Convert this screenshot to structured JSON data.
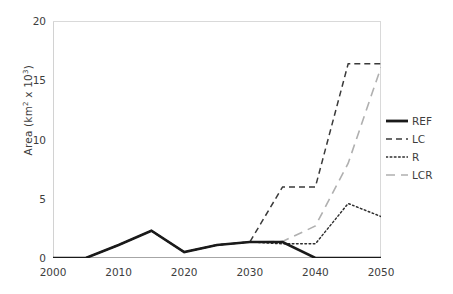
{
  "chart_data": {
    "type": "line",
    "title": "",
    "xlabel": "",
    "ylabel": "Area (km2 x 103)",
    "ylabel_parts": {
      "prefix": "Area (km",
      "sup1": "2",
      "mid": " x 10",
      "sup2": "3",
      "suffix": ")"
    },
    "xlim": [
      2000,
      2050
    ],
    "ylim": [
      0,
      20
    ],
    "xticks": [
      2000,
      2010,
      2020,
      2030,
      2040,
      2050
    ],
    "yticks": [
      0,
      5,
      10,
      15,
      20
    ],
    "xtick_labels": [
      "2000",
      "2010",
      "2020",
      "2030",
      "2040",
      "2050"
    ],
    "ytick_labels": [
      "0",
      "5",
      "10",
      "15",
      "20"
    ],
    "grid": false,
    "legend_position": "right",
    "x": [
      2000,
      2005,
      2010,
      2015,
      2020,
      2025,
      2030,
      2035,
      2040,
      2045,
      2050
    ],
    "series": [
      {
        "name": "REF",
        "style": "solid",
        "color": "#1a1a1a",
        "width": 2.6,
        "values": [
          0,
          0,
          1.1,
          2.3,
          0.5,
          1.1,
          1.35,
          1.35,
          0,
          0,
          0
        ]
      },
      {
        "name": "LC",
        "style": "dashed",
        "color": "#3a3a3a",
        "width": 1.5,
        "values": [
          0,
          0,
          1.1,
          2.3,
          0.5,
          1.1,
          1.35,
          6.0,
          6.0,
          16.4,
          16.4
        ]
      },
      {
        "name": "R",
        "style": "dotted",
        "color": "#2e2e2e",
        "width": 1.5,
        "values": [
          0,
          0,
          1.1,
          2.3,
          0.5,
          1.1,
          1.35,
          1.2,
          1.2,
          4.6,
          3.5
        ]
      },
      {
        "name": "LCR",
        "style": "longdash",
        "color": "#b0b0b0",
        "width": 1.6,
        "values": [
          0,
          0,
          1.1,
          2.3,
          0.5,
          1.1,
          1.35,
          1.4,
          2.7,
          8.0,
          16.1
        ]
      }
    ],
    "legend": [
      {
        "label": "REF",
        "style": "solid",
        "color": "#1a1a1a",
        "width": 2.8
      },
      {
        "label": "LC",
        "style": "dashed",
        "color": "#3a3a3a",
        "width": 1.5
      },
      {
        "label": "R",
        "style": "dotted",
        "color": "#2e2e2e",
        "width": 1.5
      },
      {
        "label": "LCR",
        "style": "longdash",
        "color": "#b0b0b0",
        "width": 1.6
      }
    ],
    "axis_color": "#a6a6a6"
  }
}
